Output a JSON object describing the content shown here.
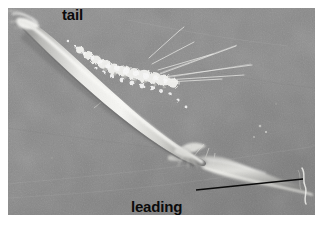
{
  "figure": {
    "kind": "scanning-electron-micrograph",
    "background_color": "#8b8b8b",
    "plate": {
      "x": 8,
      "y": 8,
      "width": 307,
      "height": 207
    },
    "page_background": "#ffffff"
  },
  "annotations": {
    "tail": {
      "label": "tail",
      "x": 62,
      "y": 7,
      "color": "#0b0b0b",
      "has_leader_line": false
    },
    "leading_edge": {
      "line1": "leading",
      "line2": "edge",
      "x": 131,
      "y": 168,
      "color": "#0b0b0b",
      "has_leader_line": true,
      "leader_line": {
        "color": "#0b0b0b",
        "x1": 196,
        "y1": 190,
        "x2": 303,
        "y2": 179,
        "width": 1.6
      }
    }
  },
  "cell": {
    "orientation": "upper-left to lower-right diagonal",
    "tail_point": {
      "x": 14,
      "y": 12
    },
    "leading_edge_point": {
      "x": 300,
      "y": 186
    },
    "body_color_highlight": "#f2f2f0",
    "body_color_mid": "#c9c9c6",
    "body_color_shadow": "#6f6f6f",
    "features": [
      "granular bumpy dorsal surface",
      "fine filopodia / retraction fibres",
      "broad lamellipodium at leading edge",
      "narrow tapering tail"
    ]
  }
}
